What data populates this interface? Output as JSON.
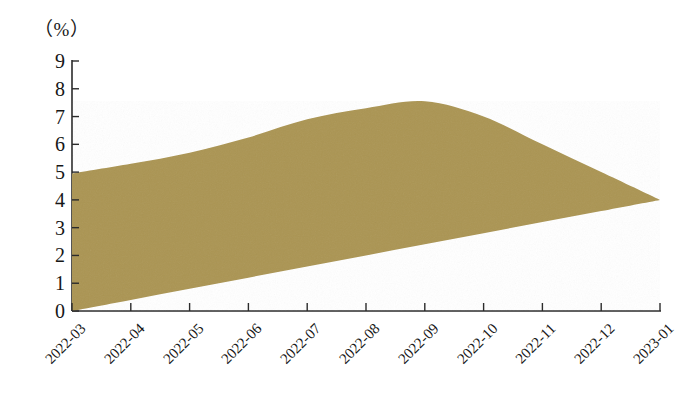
{
  "chart_data": {
    "type": "area",
    "title": "",
    "subtitle": "",
    "xlabel": "",
    "ylabel": "",
    "yunit": "（%）",
    "categories": [
      "2022-03",
      "2022-04",
      "2022-05",
      "2022-06",
      "2022-07",
      "2022-08",
      "2022-09",
      "2022-10",
      "2022-11",
      "2022-12",
      "2023-01"
    ],
    "series": [
      {
        "name": "upper",
        "values": [
          4.95,
          5.3,
          5.7,
          6.25,
          6.9,
          7.3,
          7.55,
          7.0,
          6.0,
          5.0,
          4.0
        ]
      },
      {
        "name": "lower",
        "values": [
          0.0,
          0.4,
          0.8,
          1.2,
          1.6,
          2.0,
          2.4,
          2.8,
          3.2,
          3.6,
          4.0
        ]
      }
    ],
    "ylim": [
      0,
      9
    ],
    "yticks": [
      0,
      1,
      2,
      3,
      4,
      5,
      6,
      7,
      8,
      9
    ],
    "ytick_labels": [
      "0",
      "1",
      "2",
      "3",
      "4",
      "5",
      "6",
      "7",
      "8",
      "9"
    ],
    "grid": false,
    "legend": "none",
    "fill_color": "#ab9553",
    "axis_color": "#2b2b2b",
    "xtick_rotation": -45
  },
  "axes": {
    "y_unit_text": "（%）"
  }
}
